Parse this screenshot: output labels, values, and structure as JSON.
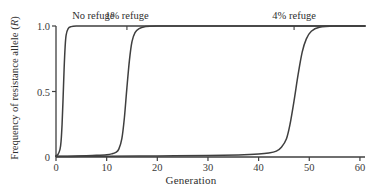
{
  "figure": {
    "background_color": "#ffffff",
    "line_color": "#3f3f3f",
    "axis_color": "#3f3f3f"
  },
  "axes": {
    "x_title": "Generation",
    "y_title_prefix": "Frequency of resistance allele (",
    "y_title_italic": "R",
    "y_title_suffix": ")",
    "x_ticks": [
      "0",
      "10",
      "20",
      "30",
      "40",
      "50",
      "60"
    ],
    "y_ticks": [
      "1.0",
      "0.5",
      "0"
    ]
  },
  "curve_labels": [
    {
      "text": "No refuge",
      "at_x": 2
    },
    {
      "text": "1% refuge",
      "at_x": 14
    },
    {
      "text": "4% refuge",
      "at_x": 47
    }
  ],
  "chart_data": {
    "type": "line",
    "title": "",
    "xlabel": "Generation",
    "ylabel": "Frequency of resistance allele (R)",
    "xlim": [
      0,
      61
    ],
    "ylim": [
      0,
      1.0
    ],
    "xticks": [
      0,
      10,
      20,
      30,
      40,
      50,
      60
    ],
    "yticks": [
      0,
      0.5,
      1.0
    ],
    "grid": false,
    "legend": "inline-labels-above-curves",
    "series": [
      {
        "name": "No refuge",
        "label_x": 2,
        "x": [
          0,
          0.4,
          0.8,
          1.0,
          1.2,
          1.4,
          1.6,
          1.8,
          2.0,
          2.4,
          3.0,
          4.0,
          6.0,
          10.0,
          20.0,
          30.0,
          40.0,
          50.0,
          61.0
        ],
        "y": [
          0.01,
          0.02,
          0.06,
          0.12,
          0.25,
          0.45,
          0.67,
          0.84,
          0.93,
          0.98,
          0.995,
          1.0,
          1.0,
          1.0,
          1.0,
          1.0,
          1.0,
          1.0,
          1.0
        ]
      },
      {
        "name": "1% refuge",
        "label_x": 14,
        "x": [
          0,
          2,
          4,
          6,
          8,
          10,
          11,
          11.8,
          12.4,
          13.0,
          13.5,
          14.0,
          14.5,
          15.0,
          15.6,
          16.4,
          17.5,
          20,
          30,
          40,
          50,
          61
        ],
        "y": [
          0.005,
          0.006,
          0.008,
          0.01,
          0.013,
          0.018,
          0.024,
          0.035,
          0.06,
          0.14,
          0.3,
          0.53,
          0.74,
          0.88,
          0.95,
          0.98,
          0.995,
          1.0,
          1.0,
          1.0,
          1.0,
          1.0
        ]
      },
      {
        "name": "4% refuge",
        "label_x": 47,
        "x": [
          0,
          5,
          10,
          20,
          30,
          36,
          40,
          42,
          43.5,
          44.5,
          45.5,
          46.2,
          47.0,
          47.8,
          48.6,
          49.4,
          50.4,
          52,
          55,
          61
        ],
        "y": [
          0.004,
          0.005,
          0.006,
          0.008,
          0.012,
          0.016,
          0.022,
          0.03,
          0.045,
          0.075,
          0.14,
          0.25,
          0.43,
          0.63,
          0.8,
          0.9,
          0.96,
          0.99,
          1.0,
          1.0
        ]
      }
    ]
  }
}
